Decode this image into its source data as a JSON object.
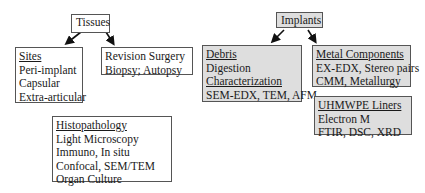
{
  "tissues": {
    "title": "Tissues",
    "sites": {
      "heading": "Sites",
      "items": [
        "Peri-implant",
        "Capsular",
        "Extra-articular"
      ]
    },
    "sources": {
      "items": [
        "Revision Surgery",
        "Biopsy; Autopsy"
      ]
    },
    "histopathology": {
      "heading": "Histopathology",
      "items": [
        "Light Microscopy",
        "Immuno, In situ",
        "Confocal, SEM/TEM",
        "Organ Culture"
      ]
    }
  },
  "implants": {
    "title": "Implants",
    "debris": {
      "heading": "Debris",
      "item1": "Digestion",
      "subheading": "Characterization",
      "item2": "SEM-EDX, TEM, AFM"
    },
    "metal": {
      "heading": "Metal Components",
      "items": [
        "EX-EDX, Stereo pairs",
        "CMM, Metallurgy"
      ]
    },
    "uhmwpe": {
      "heading": "UHMWPE Liners",
      "items": [
        "Electron M",
        "FTIR, DSC, XRD"
      ]
    }
  },
  "colors": {
    "gray_fill": "#dedede",
    "border": "#555555",
    "arrow": "#111111"
  }
}
